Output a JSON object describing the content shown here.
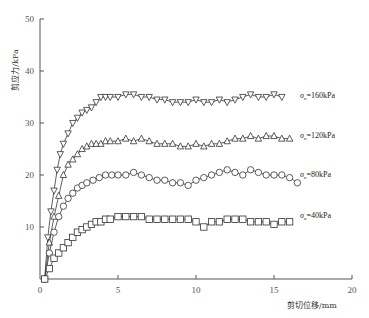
{
  "chart_data": {
    "type": "line",
    "title": "",
    "xlabel": "剪切位移/mm",
    "ylabel": "剪应力/kPa",
    "xlim": [
      0,
      20
    ],
    "ylim": [
      0,
      50
    ],
    "xticks": [
      0,
      5,
      10,
      15,
      20
    ],
    "yticks": [
      0,
      10,
      20,
      30,
      40,
      50
    ],
    "grid": false,
    "legend_position": "inline-right",
    "series": [
      {
        "name": "σn=160kPa",
        "label": "σ",
        "sub": "n",
        "suffix": "=160kPa",
        "marker": "triangle-down",
        "x": [
          0.3,
          0.5,
          0.7,
          0.9,
          1.1,
          1.3,
          1.5,
          1.8,
          2.1,
          2.4,
          2.7,
          3.0,
          3.3,
          3.6,
          3.9,
          4.2,
          4.5,
          5.0,
          5.5,
          6.0,
          6.5,
          7.0,
          7.5,
          8.0,
          8.5,
          9.0,
          9.5,
          10.0,
          10.5,
          11.0,
          11.5,
          12.0,
          12.5,
          13.0,
          13.5,
          14.0,
          14.5,
          15.0,
          15.5
        ],
        "y": [
          0,
          8,
          13,
          17,
          21,
          24,
          26,
          28,
          30,
          31,
          32,
          32.5,
          33,
          34,
          35,
          35,
          35,
          35,
          35.5,
          35.5,
          35,
          35,
          34.5,
          34.5,
          34,
          34,
          34,
          34.5,
          34,
          34,
          34.5,
          34,
          34.5,
          35,
          35.5,
          35,
          35,
          35.5,
          35
        ]
      },
      {
        "name": "σn=120kPa",
        "label": "σ",
        "sub": "n",
        "suffix": "=120kPa",
        "marker": "triangle-up",
        "x": [
          0.3,
          0.6,
          0.9,
          1.2,
          1.5,
          1.8,
          2.1,
          2.4,
          2.7,
          3.0,
          3.3,
          3.6,
          3.9,
          4.2,
          4.5,
          5.0,
          5.5,
          6.0,
          6.5,
          7.0,
          7.5,
          8.0,
          8.5,
          9.0,
          9.5,
          10.0,
          10.5,
          11.0,
          11.5,
          12.0,
          12.5,
          13.0,
          13.5,
          14.0,
          14.5,
          15.0,
          15.5,
          16.0
        ],
        "y": [
          0,
          7,
          12,
          16,
          20,
          22,
          23,
          24,
          25,
          25.5,
          26,
          26,
          26,
          26.5,
          26.5,
          26.5,
          27,
          26.5,
          27,
          26.5,
          26,
          26,
          26,
          25.5,
          25.5,
          26,
          25.5,
          26,
          26,
          26.5,
          27,
          27,
          27.5,
          27,
          27.5,
          27.5,
          27,
          27
        ]
      },
      {
        "name": "σn=80kPa",
        "label": "σ",
        "sub": "n",
        "suffix": "=80kPa",
        "marker": "circle",
        "x": [
          0.3,
          0.6,
          0.9,
          1.2,
          1.5,
          1.8,
          2.1,
          2.4,
          2.7,
          3.0,
          3.4,
          3.8,
          4.2,
          4.6,
          5.0,
          5.5,
          6.0,
          6.5,
          7.0,
          7.5,
          8.0,
          8.5,
          9.0,
          9.5,
          10.0,
          10.5,
          11.0,
          11.5,
          12.0,
          12.5,
          13.0,
          13.5,
          14.0,
          14.5,
          15.0,
          15.5,
          16.0,
          16.5
        ],
        "y": [
          0,
          5,
          9,
          12,
          14,
          15.5,
          16.5,
          17.5,
          18,
          18.5,
          19,
          19.5,
          20,
          20,
          20,
          20,
          20.5,
          20,
          19.5,
          19,
          19,
          18.5,
          18.5,
          18,
          19,
          19.5,
          20,
          20.5,
          21,
          20.5,
          20,
          21,
          20.5,
          20,
          20,
          20,
          19.5,
          18.5
        ]
      },
      {
        "name": "σn=40kPa",
        "label": "σ",
        "sub": "n",
        "suffix": "=40kPa",
        "marker": "square",
        "x": [
          0.3,
          0.6,
          0.9,
          1.2,
          1.5,
          1.8,
          2.1,
          2.4,
          2.7,
          3.0,
          3.3,
          3.6,
          3.9,
          4.2,
          4.5,
          5.0,
          5.5,
          6.0,
          6.5,
          7.0,
          7.5,
          8.0,
          8.5,
          9.0,
          9.5,
          10.0,
          10.5,
          11.0,
          11.5,
          12.0,
          12.5,
          13.0,
          13.5,
          14.0,
          14.5,
          15.0,
          15.5,
          16.0
        ],
        "y": [
          0,
          2,
          4,
          5,
          6,
          7,
          8,
          9,
          9.5,
          10,
          10.5,
          11,
          11,
          11.5,
          11.5,
          12,
          12,
          12,
          12,
          11.5,
          11.5,
          11.5,
          11.5,
          11.5,
          11.5,
          11,
          10,
          11,
          11,
          11.5,
          11.5,
          11.5,
          11,
          11,
          11,
          10.5,
          11,
          11
        ]
      }
    ]
  }
}
